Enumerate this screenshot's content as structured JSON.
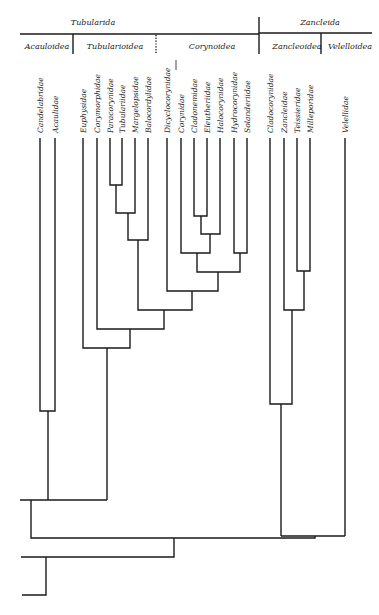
{
  "header": {
    "orders": [
      {
        "label": "Tubularida",
        "x": 93,
        "y": 18
      },
      {
        "label": "Zancleida",
        "x": 320,
        "y": 18
      }
    ],
    "superfamilies": [
      {
        "label": "Acauloidea",
        "x": 47,
        "y": 42
      },
      {
        "label": "Tubularioidea",
        "x": 115,
        "y": 42
      },
      {
        "label": "Corynoidea",
        "x": 212,
        "y": 42
      },
      {
        "label": "Zancleoidea",
        "x": 297,
        "y": 42
      },
      {
        "label": "Velelloidea",
        "x": 350,
        "y": 42
      }
    ]
  },
  "taxa": [
    {
      "label": "Candelabridae",
      "x": 40
    },
    {
      "label": "Acaulidae",
      "x": 55
    },
    {
      "label": "Euphysidae",
      "x": 83
    },
    {
      "label": "Corymorphidae",
      "x": 97
    },
    {
      "label": "Paracorynidae",
      "x": 110
    },
    {
      "label": "Tubulariidae",
      "x": 122
    },
    {
      "label": "Margelopsidae",
      "x": 135
    },
    {
      "label": "Balocordylidae",
      "x": 148
    },
    {
      "label": "Dicyclocorynidae",
      "x": 167
    },
    {
      "label": "Corynidae",
      "x": 181
    },
    {
      "label": "Cladonemidae",
      "x": 194
    },
    {
      "label": "Eleutheriidae",
      "x": 207
    },
    {
      "label": "Halocorynidae",
      "x": 220
    },
    {
      "label": "Hydrocorynidae",
      "x": 234
    },
    {
      "label": "Solanderiidae",
      "x": 247
    },
    {
      "label": "Cladocorynidae",
      "x": 270
    },
    {
      "label": "Zancleidae",
      "x": 284
    },
    {
      "label": "Teissieridae",
      "x": 297
    },
    {
      "label": "Milleporidae",
      "x": 310
    },
    {
      "label": "Velellidae",
      "x": 345
    }
  ],
  "tree": {
    "line_color": "#1a1a1a",
    "leaf_top_y": 138
  }
}
